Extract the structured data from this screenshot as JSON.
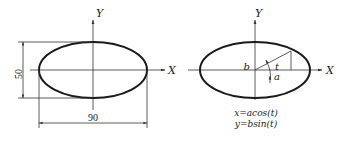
{
  "left_diagram": {
    "axis_labels": {
      "x": "X",
      "y": "Y"
    },
    "dimensions": {
      "height": "50",
      "width": "90"
    }
  },
  "right_diagram": {
    "axis_labels": {
      "x": "X",
      "y": "Y"
    },
    "annotations": {
      "semi_minor": "b",
      "semi_major": "a",
      "angle": "t"
    },
    "equations": {
      "x_eq": "x=acos(t)",
      "y_eq": "y=bsin(t)"
    }
  },
  "colors": {
    "stroke": "#1a1a1a",
    "background": "#ffffff"
  }
}
